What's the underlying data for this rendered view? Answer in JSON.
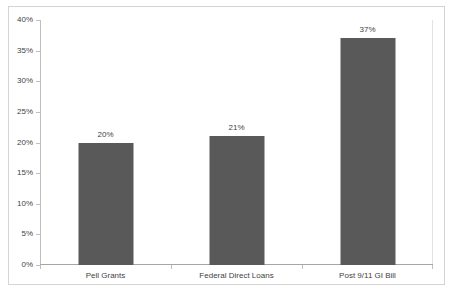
{
  "chart_data": {
    "type": "bar",
    "title": "",
    "subtitle": "",
    "xlabel": "",
    "ylabel": "",
    "categories": [
      "Pell Grants",
      "Federal Direct Loans",
      "Post 9/11 GI Bill"
    ],
    "values": [
      20,
      21,
      37
    ],
    "data_labels": [
      "20%",
      "21%",
      "37%"
    ],
    "ylim": [
      0,
      40
    ],
    "ytick_values": [
      0,
      5,
      10,
      15,
      20,
      25,
      30,
      35,
      40
    ],
    "ytick_labels": [
      "0%",
      "5%",
      "10%",
      "15%",
      "20%",
      "25%",
      "30%",
      "35%",
      "40%"
    ],
    "grid": false,
    "legend": false,
    "legend_position": "none",
    "series": [
      {
        "name": "",
        "values": [
          20,
          21,
          37
        ]
      }
    ],
    "colors": {
      "bar_fill": "#595959",
      "plot_background": "#ffffff",
      "axis_line": "#bfbfbf",
      "baseline": "#a6a6a6",
      "border": "#d4d4d4",
      "text": "#3f3f3f"
    }
  }
}
